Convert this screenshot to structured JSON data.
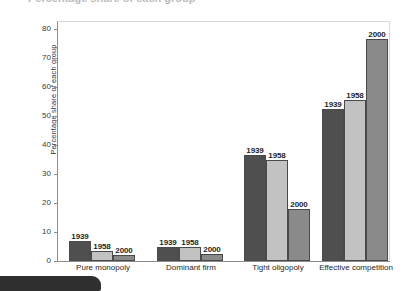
{
  "figure": {
    "cut_off_title": "Percentage share of each group",
    "bottom_tab_label": ""
  },
  "chart_data": {
    "type": "bar",
    "title": "",
    "subtitle": "",
    "xlabel": "",
    "ylabel": "Percentage share of each group",
    "ylim": [
      0,
      80
    ],
    "yticks": [
      0,
      10,
      20,
      30,
      40,
      50,
      60,
      70,
      80
    ],
    "ytick_labels": [
      "0",
      "10",
      "20",
      "30",
      "40",
      "50",
      "60",
      "70",
      "80"
    ],
    "grid": false,
    "legend": "none",
    "categories": [
      "Pure monopoly",
      "Dominant firm",
      "Tight oligopoly",
      "Effective competition"
    ],
    "series": [
      {
        "name": "1939",
        "color": "#4f4f4f",
        "values": [
          7,
          5,
          36.5,
          52.5
        ]
      },
      {
        "name": "1958",
        "color": "#c2c2c2",
        "values": [
          3.5,
          5,
          35,
          55.5
        ]
      },
      {
        "name": "2000",
        "color": "#8a8a8a",
        "values": [
          2,
          2.5,
          18,
          76.5
        ]
      }
    ],
    "bar_labels": [
      [
        "1939",
        "1958",
        "2000"
      ],
      [
        "1939",
        "1958",
        "2000"
      ],
      [
        "1939",
        "1958",
        "2000"
      ],
      [
        "1939",
        "1958",
        "2000"
      ]
    ]
  },
  "colors": {
    "series_1939": "#4f4f4f",
    "series_1958": "#c2c2c2",
    "series_2000": "#8a8a8a",
    "axis": "#8d8d8d",
    "text": "#262626",
    "bottom_tab": "#2f2f2f"
  }
}
